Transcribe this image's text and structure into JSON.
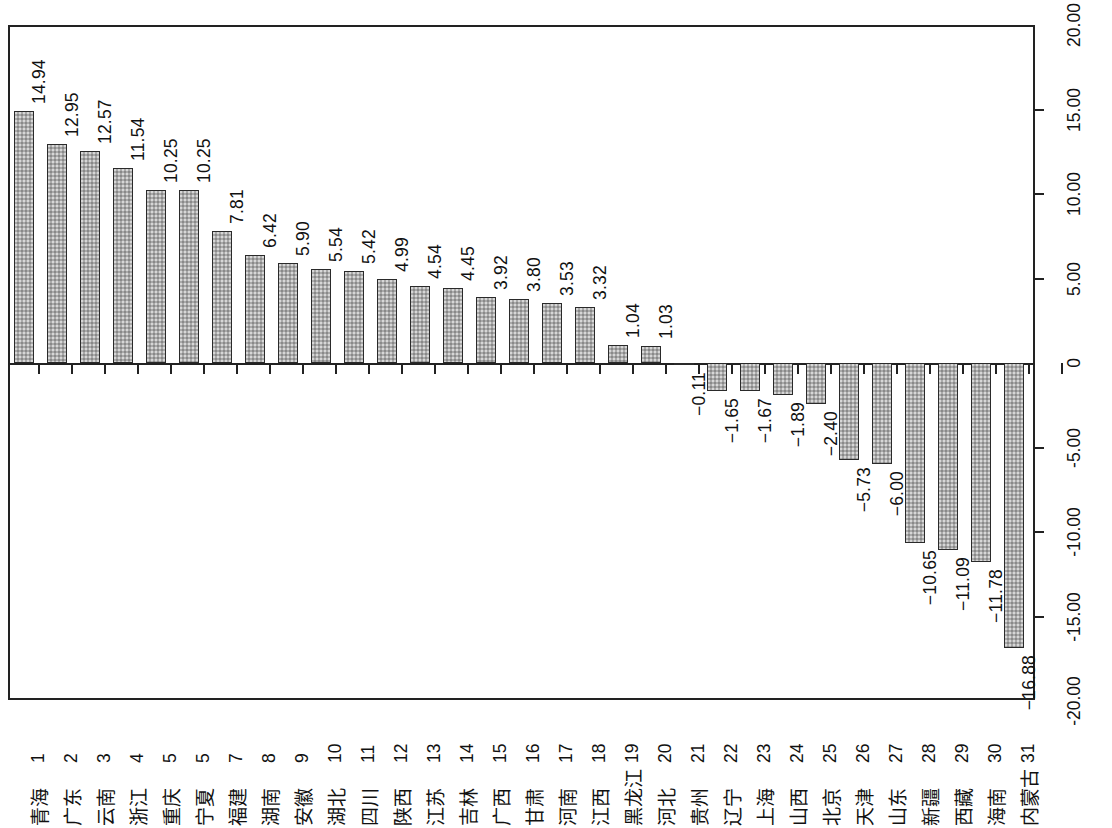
{
  "chart_data": {
    "type": "bar",
    "title": "",
    "subtitle": "",
    "xlabel": "",
    "ylabel": "",
    "ylim": [
      -20,
      20
    ],
    "ytick_labels": [
      "20.00",
      "15.00",
      "10.00",
      "5.00",
      "0",
      "-5.00",
      "-10.00",
      "-15.00",
      "-20.00"
    ],
    "ytick_values": [
      20,
      15,
      10,
      5,
      0,
      -5,
      -10,
      -15,
      -20
    ],
    "grid": false,
    "legend": null,
    "bar_color": "#a9a9a9",
    "bar_border_color": "#2a2a2a",
    "axis_position": "right",
    "categories": [
      "青海",
      "广东",
      "云南",
      "浙江",
      "重庆",
      "宁夏",
      "福建",
      "湖南",
      "安徽",
      "湖北",
      "四川",
      "陕西",
      "江苏",
      "吉林",
      "广西",
      "甘肃",
      "河南",
      "江西",
      "黑龙江",
      "河北",
      "贵州",
      "辽宁",
      "上海",
      "山西",
      "北京",
      "天津",
      "山东",
      "新疆",
      "西藏",
      "海南",
      "内蒙古"
    ],
    "ranks": [
      "1",
      "2",
      "3",
      "4",
      "5",
      "5",
      "7",
      "8",
      "9",
      "10",
      "11",
      "12",
      "13",
      "14",
      "15",
      "16",
      "17",
      "18",
      "19",
      "20",
      "21",
      "22",
      "23",
      "24",
      "25",
      "26",
      "27",
      "28",
      "29",
      "30",
      "31"
    ],
    "values": [
      14.94,
      12.95,
      12.57,
      11.54,
      10.25,
      10.25,
      7.81,
      6.42,
      5.9,
      5.54,
      5.42,
      4.99,
      4.54,
      4.45,
      3.92,
      3.8,
      3.53,
      3.32,
      1.04,
      1.03,
      -0.11,
      -1.65,
      -1.67,
      -1.89,
      -2.4,
      -5.73,
      -6.0,
      -10.65,
      -11.09,
      -11.78,
      -16.88
    ],
    "value_labels": [
      "14.94",
      "12.95",
      "12.57",
      "11.54",
      "10.25",
      "10.25",
      "7.81",
      "6.42",
      "5.90",
      "5.54",
      "5.42",
      "4.99",
      "4.54",
      "4.45",
      "3.92",
      "3.80",
      "3.53",
      "3.32",
      "1.04",
      "1.03",
      "−0.11",
      "−1.65",
      "−1.67",
      "−1.89",
      "−2.40",
      "−5.73",
      "−6.00",
      "−10.65",
      "−11.09",
      "−11.78",
      "−16.88"
    ]
  }
}
